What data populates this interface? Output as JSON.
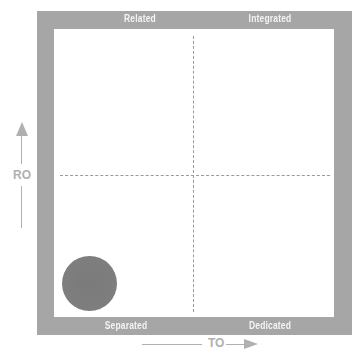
{
  "diagram": {
    "type": "2x2 quadrant matrix",
    "quadrant_labels": {
      "top_left": "Related",
      "top_right": "Integrated",
      "bottom_left": "Separated",
      "bottom_right": "Dedicated"
    },
    "y_axis": {
      "label": "RO",
      "direction": "up"
    },
    "x_axis": {
      "label": "TO",
      "direction": "right"
    },
    "marker": {
      "shape": "circle",
      "quadrant": "bottom_left",
      "color": "#7e7e7e"
    },
    "colors": {
      "frame": "#a6a6a6",
      "label_text": "#f4f4f4",
      "axis": "#b0b0b0",
      "dashes": "#9a9a9a"
    }
  }
}
